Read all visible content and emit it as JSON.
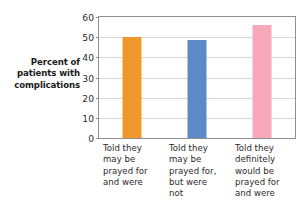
{
  "chart_data": {
    "type": "bar",
    "title": "",
    "subtitle": "",
    "xlabel": "",
    "ylabel": "Percent of patients with complications",
    "ylabel_lines": [
      "Percent of",
      "patients with",
      "complications"
    ],
    "categories": [
      "Told they may be prayed for and were",
      "Told they may be prayed for, but were not",
      "Told they definitely would be prayed for and were"
    ],
    "category_lines": [
      [
        "Told they",
        "may be",
        "prayed for",
        "and were"
      ],
      [
        "Told they",
        "may be",
        "prayed for,",
        "but were",
        "not"
      ],
      [
        "Told they",
        "definitely",
        "would be",
        "prayed for",
        "and were"
      ]
    ],
    "values": [
      50,
      48.5,
      56
    ],
    "bar_colors": [
      "#F0982E",
      "#5B8AC8",
      "#F7A8BB"
    ],
    "ylim": [
      0,
      60
    ],
    "yticks": [
      0,
      10,
      20,
      30,
      40,
      50,
      60
    ],
    "ytick_labels": [
      "0",
      "10",
      "20",
      "30",
      "40",
      "50",
      "60"
    ],
    "grid": true,
    "grid_color": "#D6D6D6",
    "legend": false,
    "axis_color": "#8F8F8F",
    "background": "#FFFFFF"
  }
}
